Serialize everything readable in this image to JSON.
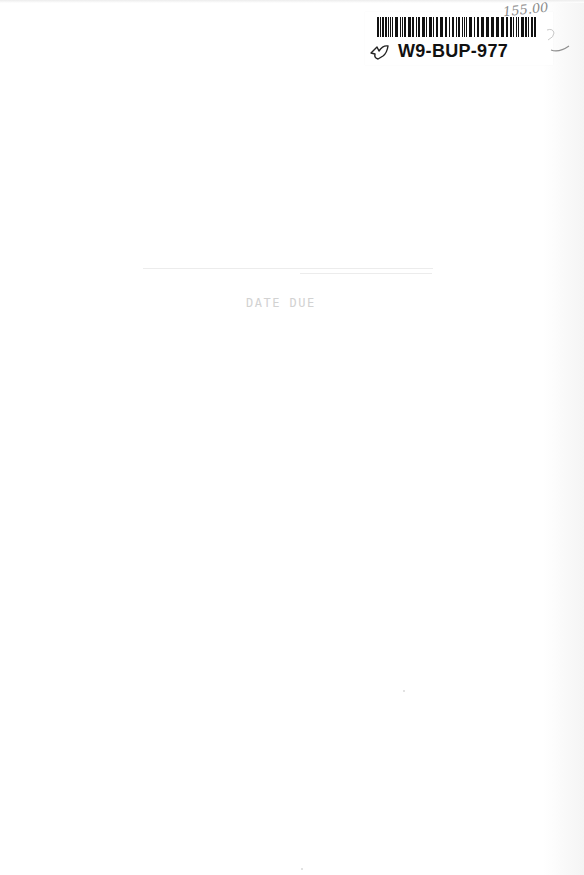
{
  "document": {
    "type": "book endpaper / blank page",
    "background_color": "#ffffff"
  },
  "label": {
    "barcode_id": "W9-BUP-977",
    "barcode_color": "#111111",
    "icon": "leaf-bookmark-icon"
  },
  "handwriting": {
    "price": "155.00",
    "mark": "2"
  },
  "bleed_through": {
    "heading": "DATE DUE"
  }
}
